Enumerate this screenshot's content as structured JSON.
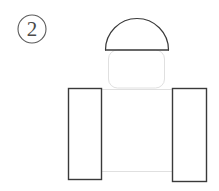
{
  "figure": {
    "label": "2",
    "caption": "",
    "background_color": "#ffffff",
    "canvas": {
      "width": 219,
      "height": 191
    },
    "stroke_colors": {
      "dark": "#3a3a3a",
      "mid": "#555555",
      "faint": "#d8d8d8",
      "very_faint": "#e4e4e4"
    },
    "badge": {
      "name": "step-number-badge",
      "text": "2",
      "center_x": 32,
      "center_y": 29,
      "radius": 14,
      "stroke_color": "#5a5a5a",
      "stroke_width": 1.1
    },
    "shapes": [
      {
        "name": "dome-cap",
        "type": "semicircle",
        "description": "Dark outlined semicircular dome cap at top",
        "left": 105,
        "right": 168,
        "top": 18,
        "baseline_y": 50,
        "stroke_color": "#3a3a3a",
        "stroke_width": 1.2,
        "fill": "none"
      },
      {
        "name": "neck-body",
        "type": "rounded-rectangle",
        "description": "Faint rounded rectangle body beneath the dome",
        "x": 108,
        "y": 50,
        "width": 57,
        "height": 38,
        "corner_radius": 9,
        "stroke_color": "#e0e0e0",
        "stroke_width": 1,
        "fill": "none"
      },
      {
        "name": "base-plate",
        "type": "rectangle",
        "description": "Faint wide rectangle spanning between the two upright blocks",
        "x": 68,
        "y": 89,
        "width": 139,
        "height": 83,
        "stroke_color": "#e0e0e0",
        "stroke_width": 1,
        "fill": "none"
      },
      {
        "name": "left-upright-block",
        "type": "rectangle",
        "description": "Left dark outlined vertical rectangle",
        "x": 68,
        "y": 88,
        "width": 34,
        "height": 92,
        "stroke_color": "#3a3a3a",
        "stroke_width": 1.4,
        "fill": "#ffffff"
      },
      {
        "name": "right-upright-block",
        "type": "rectangle",
        "description": "Right dark outlined vertical rectangle",
        "x": 172,
        "y": 88,
        "width": 35,
        "height": 94,
        "stroke_color": "#3a3a3a",
        "stroke_width": 1.4,
        "fill": "#ffffff"
      }
    ]
  }
}
